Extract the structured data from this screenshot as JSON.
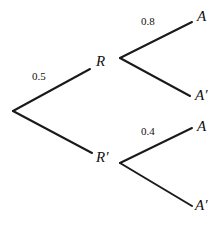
{
  "diagram": {
    "type": "probability-tree",
    "background_color": "#ffffff",
    "line_color": "#1a1a1a",
    "line_width": 2,
    "root": {
      "name": "root-node",
      "x": 13,
      "y": 111
    },
    "nodes": [
      {
        "id": "R",
        "label": "R",
        "x": 120,
        "y": 58,
        "label_x": 96,
        "label_y": 54
      },
      {
        "id": "Rp",
        "label": "R′",
        "x": 120,
        "y": 163,
        "label_x": 96,
        "label_y": 150
      },
      {
        "id": "A1",
        "label": "A",
        "x": 192,
        "y": 22,
        "label_x": 197,
        "label_y": 9
      },
      {
        "id": "Ap1",
        "label": "A′",
        "x": 190,
        "y": 96,
        "label_x": 195,
        "label_y": 88
      },
      {
        "id": "A2",
        "label": "A",
        "x": 192,
        "y": 128,
        "label_x": 197,
        "label_y": 119
      },
      {
        "id": "Ap2",
        "label": "A′",
        "x": 192,
        "y": 206,
        "label_x": 195,
        "label_y": 198
      }
    ],
    "edges": [
      {
        "from": "root",
        "to": "R",
        "x1": 13,
        "y1": 111,
        "x2": 90,
        "y2": 69,
        "label": "0.5",
        "label_x": 32,
        "label_y": 71
      },
      {
        "from": "root",
        "to": "Rp",
        "x1": 13,
        "y1": 111,
        "x2": 92,
        "y2": 153,
        "label": "",
        "label_x": 0,
        "label_y": 0
      },
      {
        "from": "R",
        "to": "A1",
        "x1": 120,
        "y1": 58,
        "x2": 192,
        "y2": 22,
        "label": "0.8",
        "label_x": 141,
        "label_y": 16
      },
      {
        "from": "R",
        "to": "Ap1",
        "x1": 120,
        "y1": 58,
        "x2": 190,
        "y2": 96,
        "label": "",
        "label_x": 0,
        "label_y": 0
      },
      {
        "from": "Rp",
        "to": "A2",
        "x1": 120,
        "y1": 163,
        "x2": 192,
        "y2": 128,
        "label": "0.4",
        "label_x": 141,
        "label_y": 126
      },
      {
        "from": "Rp",
        "to": "Ap2",
        "x1": 120,
        "y1": 163,
        "x2": 192,
        "y2": 206,
        "label": "",
        "label_x": 0,
        "label_y": 0
      }
    ],
    "labels": {
      "node_R": "R",
      "node_R_prime": "R′",
      "outcome_A_top": "A",
      "outcome_A_prime_top": "A′",
      "outcome_A_bottom": "A",
      "outcome_A_prime_bottom": "A′",
      "prob_root_to_R": "0.5",
      "prob_R_to_A": "0.8",
      "prob_Rprime_to_A": "0.4"
    }
  }
}
